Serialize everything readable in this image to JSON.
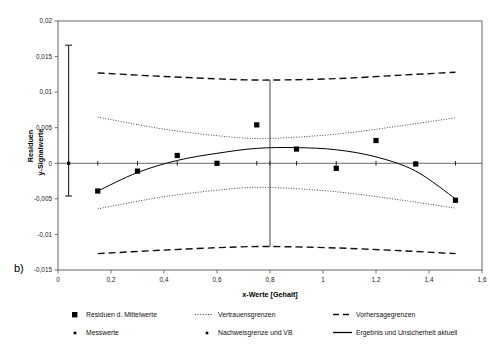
{
  "panel": {
    "label": "b)"
  },
  "chart_data": {
    "type": "scatter",
    "title": "",
    "xlabel": "x-Werte [Gehalt]",
    "ylabel_line1": "Residuen",
    "ylabel_line2": "y-Signalwerte",
    "xlim": [
      0,
      1.6
    ],
    "ylim": [
      -0.015,
      0.02
    ],
    "xticks": [
      0,
      0.2,
      0.4,
      0.6,
      0.8,
      1,
      1.2,
      1.4,
      1.6
    ],
    "xticklabels": [
      "0",
      "0,2",
      "0,4",
      "0,6",
      "0,8",
      "1",
      "1,2",
      "1,4",
      "1,6"
    ],
    "yticks": [
      -0.015,
      -0.01,
      -0.005,
      0,
      0.005,
      0.01,
      0.015,
      0.02
    ],
    "yticklabels": [
      "-0,015",
      "-0,01",
      "-0,005",
      "0",
      "0,005",
      "0,01",
      "0,015",
      "0,02"
    ],
    "grid": false,
    "legend_position": "bottom",
    "series": [
      {
        "name": "Residuen d. Mittelwerte",
        "type": "scatter",
        "marker": "square",
        "x": [
          0.15,
          0.3,
          0.45,
          0.6,
          0.75,
          0.9,
          1.05,
          1.2,
          1.35,
          1.5
        ],
        "y": [
          -0.0039,
          -0.0011,
          0.0011,
          0.0,
          0.0054,
          0.002,
          -0.0007,
          0.0032,
          -0.0001,
          -0.0052
        ]
      },
      {
        "name": "Messwerte",
        "type": "scatter",
        "marker": "dot",
        "x": [
          0.04,
          0.15,
          0.3,
          0.45,
          0.6,
          0.75,
          0.8,
          0.9,
          1.05,
          1.2,
          1.35,
          1.5
        ],
        "y": [
          0,
          0,
          0,
          0,
          0,
          0,
          0,
          0,
          0,
          0,
          0,
          0
        ]
      },
      {
        "name": "Vertrauensgrenzen",
        "type": "line",
        "style": "dotted",
        "upper_x": [
          0.15,
          0.4,
          0.65,
          0.8,
          1.05,
          1.3,
          1.5
        ],
        "upper_y": [
          0.0065,
          0.0048,
          0.0037,
          0.0035,
          0.0041,
          0.0053,
          0.0064
        ],
        "lower_x": [
          0.15,
          0.4,
          0.65,
          0.8,
          1.05,
          1.3,
          1.5
        ],
        "lower_y": [
          -0.0064,
          -0.0047,
          -0.0036,
          -0.0034,
          -0.004,
          -0.0052,
          -0.0063
        ]
      },
      {
        "name": "Vorhersagegrenzen",
        "type": "line",
        "style": "dashed",
        "upper_x": [
          0.15,
          0.4,
          0.65,
          0.8,
          1.05,
          1.3,
          1.5
        ],
        "upper_y": [
          0.0127,
          0.0122,
          0.0118,
          0.0117,
          0.0119,
          0.0124,
          0.0128
        ],
        "lower_x": [
          0.15,
          0.4,
          0.65,
          0.8,
          1.05,
          1.3,
          1.5
        ],
        "lower_y": [
          -0.0127,
          -0.0122,
          -0.0118,
          -0.0117,
          -0.0119,
          -0.0123,
          -0.0127
        ]
      },
      {
        "name": "Ergebnis und Unsicherheit aktuell",
        "type": "line",
        "style": "solid",
        "x": [
          0.15,
          0.3,
          0.45,
          0.6,
          0.75,
          0.9,
          1.05,
          1.2,
          1.35,
          1.5
        ],
        "y": [
          -0.0039,
          -0.0013,
          0.0004,
          0.0014,
          0.0021,
          0.0022,
          0.0019,
          0.0009,
          -0.0011,
          -0.005
        ]
      },
      {
        "name": "Nachweisgrenze und VB",
        "type": "errorbar",
        "x": 0.04,
        "y": 0.0,
        "y_upper": 0.0166,
        "y_lower": -0.0046
      },
      {
        "name": "Aktueller Wert Marker",
        "type": "vline",
        "x": 0.8,
        "y_top": 0.0117,
        "y_bottom": -0.0117
      }
    ]
  },
  "legend": {
    "entries": [
      {
        "label": "Residuen d. Mittelwerte",
        "marker": "square",
        "color": "#000000"
      },
      {
        "label": "Vertrauensgrenzen",
        "marker": "dotted-line",
        "color": "#000000"
      },
      {
        "label": "Vorhersagegrenzen",
        "marker": "dashed-line",
        "color": "#000000"
      },
      {
        "label": "Messwerte",
        "marker": "small-dot",
        "color": "#000000"
      },
      {
        "label": "Nachweisgrenze und VB",
        "marker": "small-dot",
        "color": "#000000"
      },
      {
        "label": "Ergebnis und Unsicherheit aktuell",
        "marker": "solid-line",
        "color": "#000000"
      }
    ]
  },
  "colors": {
    "ink": "#000000",
    "axis": "#4d4d4d",
    "background": "#ffffff"
  }
}
